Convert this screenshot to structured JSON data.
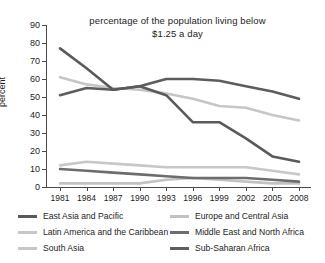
{
  "chart_data": {
    "type": "line",
    "title": "percentage of the population living below $1.25 a day",
    "title_line1": "percentage of the population living below",
    "title_line2": "$1.25 a day",
    "xlabel": "",
    "ylabel": "percent",
    "ylim": [
      0,
      90
    ],
    "ytick_step": 10,
    "grid": false,
    "legend_position": "bottom",
    "x": [
      "1981",
      "1984",
      "1987",
      "1990",
      "1993",
      "1996",
      "1999",
      "2002",
      "2005",
      "2008"
    ],
    "categories": [
      "1981",
      "1984",
      "1987",
      "1990",
      "1993",
      "1996",
      "1999",
      "2002",
      "2005",
      "2008"
    ],
    "yticks": [
      "0",
      "10",
      "20",
      "30",
      "40",
      "50",
      "60",
      "70",
      "80",
      "90"
    ],
    "series": [
      {
        "name": "East Asia and Pacific",
        "color": "#5a5a5a",
        "values": [
          77,
          66,
          54,
          56,
          51,
          36,
          36,
          27,
          17,
          14
        ]
      },
      {
        "name": "Europe and Central Asia",
        "color": "#c2c2c2",
        "values": [
          2,
          2,
          2,
          2,
          4,
          5,
          4,
          3,
          2,
          2
        ]
      },
      {
        "name": "Latin America and the Caribbean",
        "color": "#c8c8c8",
        "values": [
          12,
          14,
          13,
          12,
          11,
          11,
          11,
          11,
          9,
          7
        ]
      },
      {
        "name": "Middle East and North Africa",
        "color": "#6d6d6d",
        "values": [
          10,
          9,
          8,
          7,
          6,
          5,
          5,
          5,
          4,
          3
        ]
      },
      {
        "name": "South Asia",
        "color": "#c6c6c6",
        "values": [
          61,
          57,
          55,
          54,
          52,
          49,
          45,
          44,
          40,
          37
        ]
      },
      {
        "name": "Sub-Saharan Africa",
        "color": "#5d5d5d",
        "values": [
          51,
          55,
          54,
          56,
          60,
          60,
          59,
          56,
          53,
          49
        ]
      }
    ]
  },
  "legend": {
    "left_column": [
      {
        "label": "East Asia and Pacific",
        "color": "#5a5a5a"
      },
      {
        "label": "Latin America and the Caribbean",
        "color": "#c8c8c8"
      },
      {
        "label": "South Asia",
        "color": "#c6c6c6"
      }
    ],
    "right_column": [
      {
        "label": "Europe and Central Asia",
        "color": "#c2c2c2"
      },
      {
        "label": "Middle East and North Africa",
        "color": "#6d6d6d"
      },
      {
        "label": "Sub-Saharan Africa",
        "color": "#5d5d5d"
      }
    ]
  }
}
